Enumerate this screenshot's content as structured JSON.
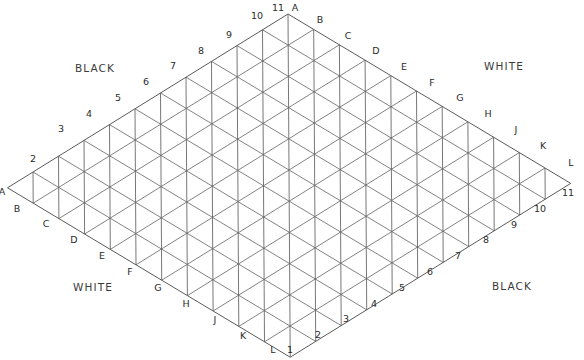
{
  "figure": {
    "name": "rhombic-triangular-lattice-board",
    "width": 584,
    "height": 360,
    "background_color": "#ffffff",
    "line_color": "#6b6b6b"
  },
  "geometry": {
    "order": 11,
    "top_vertex": {
      "x": 288,
      "y": 14
    },
    "left_vertex": {
      "x": 7,
      "y": 188
    },
    "right_vertex": {
      "x": 570,
      "y": 183
    },
    "bottom_vertex": {
      "x": 289,
      "y": 345
    },
    "step_right_x": 25.7,
    "step_right_y": 15.4,
    "step_down_x": -25.5,
    "step_down_y": 15.8
  },
  "regions": [
    {
      "id": "region-top-left",
      "label": "BLACK",
      "x": 95,
      "y": 72
    },
    {
      "id": "region-top-right",
      "label": "WHITE",
      "x": 504,
      "y": 70
    },
    {
      "id": "region-bottom-left",
      "label": "WHITE",
      "x": 93,
      "y": 291
    },
    {
      "id": "region-bottom-right",
      "label": "BLACK",
      "x": 512,
      "y": 290
    }
  ],
  "axes": {
    "numbers_upper_left": {
      "name": "upper-left-number-axis",
      "labels": [
        "2",
        "3",
        "4",
        "5",
        "6",
        "7",
        "8",
        "9",
        "10",
        "11"
      ]
    },
    "letters_upper_right": {
      "name": "upper-right-letter-axis",
      "labels": [
        "A",
        "B",
        "C",
        "D",
        "E",
        "F",
        "G",
        "H",
        "J",
        "K",
        "L"
      ]
    },
    "letters_lower_left": {
      "name": "lower-left-letter-axis",
      "labels": [
        "A",
        "B",
        "C",
        "D",
        "E",
        "F",
        "G",
        "H",
        "J",
        "K",
        "L"
      ]
    },
    "numbers_lower_right": {
      "name": "lower-right-number-axis",
      "labels": [
        "1",
        "2",
        "3",
        "4",
        "5",
        "6",
        "7",
        "8",
        "9",
        "10",
        "11"
      ]
    }
  },
  "tick_labels": [
    {
      "text": "2",
      "x": 33,
      "y": 162,
      "axis": "upper-left-number-axis"
    },
    {
      "text": "3",
      "x": 61,
      "y": 132,
      "axis": "upper-left-number-axis"
    },
    {
      "text": "4",
      "x": 89,
      "y": 117,
      "axis": "upper-left-number-axis"
    },
    {
      "text": "5",
      "x": 118,
      "y": 101,
      "axis": "upper-left-number-axis"
    },
    {
      "text": "6",
      "x": 146,
      "y": 85,
      "axis": "upper-left-number-axis"
    },
    {
      "text": "7",
      "x": 173,
      "y": 69,
      "axis": "upper-left-number-axis"
    },
    {
      "text": "8",
      "x": 201,
      "y": 54,
      "axis": "upper-left-number-axis"
    },
    {
      "text": "9",
      "x": 229,
      "y": 38,
      "axis": "upper-left-number-axis"
    },
    {
      "text": "10",
      "x": 257,
      "y": 19,
      "axis": "upper-left-number-axis"
    },
    {
      "text": "11",
      "x": 278,
      "y": 11,
      "axis": "upper-left-number-axis"
    },
    {
      "text": "A",
      "x": 295,
      "y": 11,
      "axis": "upper-right-letter-axis"
    },
    {
      "text": "B",
      "x": 320,
      "y": 23,
      "axis": "upper-right-letter-axis"
    },
    {
      "text": "C",
      "x": 348,
      "y": 39,
      "axis": "upper-right-letter-axis"
    },
    {
      "text": "D",
      "x": 376,
      "y": 54,
      "axis": "upper-right-letter-axis"
    },
    {
      "text": "E",
      "x": 404,
      "y": 70,
      "axis": "upper-right-letter-axis"
    },
    {
      "text": "F",
      "x": 432,
      "y": 86,
      "axis": "upper-right-letter-axis"
    },
    {
      "text": "G",
      "x": 460,
      "y": 101,
      "axis": "upper-right-letter-axis"
    },
    {
      "text": "H",
      "x": 488,
      "y": 117,
      "axis": "upper-right-letter-axis"
    },
    {
      "text": "J",
      "x": 516,
      "y": 133,
      "axis": "upper-right-letter-axis"
    },
    {
      "text": "K",
      "x": 543,
      "y": 149,
      "axis": "upper-right-letter-axis"
    },
    {
      "text": "L",
      "x": 571,
      "y": 166,
      "axis": "upper-right-letter-axis"
    },
    {
      "text": "A",
      "x": 2,
      "y": 195,
      "axis": "lower-left-letter-axis"
    },
    {
      "text": "B",
      "x": 17,
      "y": 212,
      "axis": "lower-left-letter-axis"
    },
    {
      "text": "C",
      "x": 46,
      "y": 227,
      "axis": "lower-left-letter-axis"
    },
    {
      "text": "D",
      "x": 74,
      "y": 243,
      "axis": "lower-left-letter-axis"
    },
    {
      "text": "E",
      "x": 102,
      "y": 259,
      "axis": "lower-left-letter-axis"
    },
    {
      "text": "F",
      "x": 130,
      "y": 275,
      "axis": "lower-left-letter-axis"
    },
    {
      "text": "G",
      "x": 158,
      "y": 291,
      "axis": "lower-left-letter-axis"
    },
    {
      "text": "H",
      "x": 186,
      "y": 307,
      "axis": "lower-left-letter-axis"
    },
    {
      "text": "J",
      "x": 215,
      "y": 323,
      "axis": "lower-left-letter-axis"
    },
    {
      "text": "K",
      "x": 243,
      "y": 339,
      "axis": "lower-left-letter-axis"
    },
    {
      "text": "L",
      "x": 273,
      "y": 353,
      "axis": "lower-left-letter-axis"
    },
    {
      "text": "1",
      "x": 290,
      "y": 353,
      "axis": "lower-right-number-axis"
    },
    {
      "text": "2",
      "x": 318,
      "y": 338,
      "axis": "lower-right-number-axis"
    },
    {
      "text": "3",
      "x": 346,
      "y": 322,
      "axis": "lower-right-number-axis"
    },
    {
      "text": "4",
      "x": 374,
      "y": 307,
      "axis": "lower-right-number-axis"
    },
    {
      "text": "5",
      "x": 402,
      "y": 291,
      "axis": "lower-right-number-axis"
    },
    {
      "text": "6",
      "x": 430,
      "y": 275,
      "axis": "lower-right-number-axis"
    },
    {
      "text": "7",
      "x": 458,
      "y": 259,
      "axis": "lower-right-number-axis"
    },
    {
      "text": "8",
      "x": 486,
      "y": 243,
      "axis": "lower-right-number-axis"
    },
    {
      "text": "9",
      "x": 514,
      "y": 228,
      "axis": "lower-right-number-axis"
    },
    {
      "text": "10",
      "x": 540,
      "y": 212,
      "axis": "lower-right-number-axis"
    },
    {
      "text": "11",
      "x": 568,
      "y": 196,
      "axis": "lower-right-number-axis"
    }
  ]
}
